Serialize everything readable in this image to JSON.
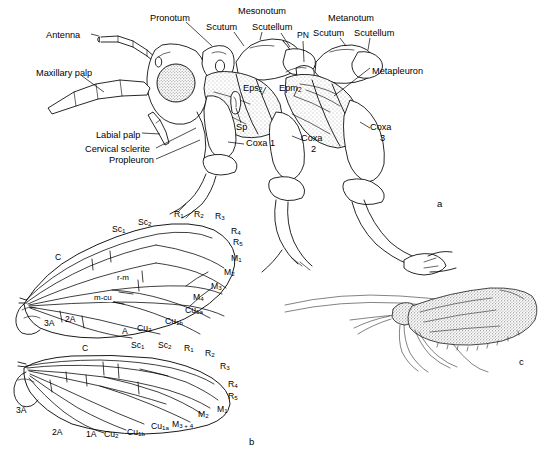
{
  "figure": {
    "panels": [
      {
        "id": "a",
        "letter": "a",
        "caption": "Lateral view of head and thorax with sclerites labeled"
      },
      {
        "id": "b",
        "letter": "b",
        "caption": "Forewing and hindwing venation"
      },
      {
        "id": "c",
        "letter": "c",
        "caption": "Whole adult in lateral view with wings at rest"
      }
    ]
  },
  "panel_a": {
    "letter": "a",
    "labels": [
      {
        "name": "antenna",
        "text": "Antenna",
        "x": 46,
        "y": 31,
        "align": "left"
      },
      {
        "name": "maxillary-palp",
        "text": "Maxillary palp",
        "x": 36,
        "y": 69,
        "align": "left"
      },
      {
        "name": "labial-palp",
        "text": "Labial palp",
        "x": 96,
        "y": 131,
        "align": "left"
      },
      {
        "name": "cervical-sclerite",
        "text": "Cervical sclerite",
        "x": 85,
        "y": 147,
        "align": "left"
      },
      {
        "name": "propleuron",
        "text": "Propleuron",
        "x": 109,
        "y": 158,
        "align": "left"
      },
      {
        "name": "pronotum",
        "text": "Pronotum",
        "x": 150,
        "y": 17,
        "align": "left"
      },
      {
        "name": "mesonotum",
        "text": "Mesonotum",
        "x": 238,
        "y": 10,
        "align": "left"
      },
      {
        "name": "meso-scutum",
        "text": "Scutum",
        "x": 210,
        "y": 26,
        "align": "left"
      },
      {
        "name": "meso-scutellum",
        "text": "Scutellum",
        "x": 255,
        "y": 26,
        "align": "left"
      },
      {
        "name": "postnotum",
        "text": "PN",
        "x": 298,
        "y": 34,
        "align": "left"
      },
      {
        "name": "metanotum",
        "text": "Metanotum",
        "x": 330,
        "y": 17,
        "align": "left"
      },
      {
        "name": "meta-scutum",
        "text": "Scutum",
        "x": 316,
        "y": 32,
        "align": "left"
      },
      {
        "name": "meta-scutellum",
        "text": "Scutellum",
        "x": 355,
        "y": 32,
        "align": "left"
      },
      {
        "name": "metapleuron",
        "text": "Metapleuron",
        "x": 372,
        "y": 71,
        "align": "left"
      },
      {
        "name": "spiracle",
        "text": "Sp",
        "x": 237,
        "y": 127,
        "align": "left"
      },
      {
        "name": "coxa-1",
        "text": "Coxa 1",
        "x": 246,
        "y": 147,
        "align": "left"
      },
      {
        "name": "coxa-2-line1",
        "text": "Coxa",
        "x": 303,
        "y": 140,
        "align": "left"
      },
      {
        "name": "coxa-2-line2",
        "text": "2",
        "x": 311,
        "y": 151,
        "align": "left"
      },
      {
        "name": "coxa-3-line1",
        "text": "Coxa",
        "x": 372,
        "y": 128,
        "align": "left"
      },
      {
        "name": "coxa-3-line2",
        "text": "3",
        "x": 380,
        "y": 139,
        "align": "left"
      }
    ],
    "subscript_labels": [
      {
        "name": "episternum-2",
        "base": "Eps",
        "sub": "2",
        "x": 245,
        "y": 89
      },
      {
        "name": "epimeron-2",
        "base": "Epm",
        "sub": "2",
        "x": 281,
        "y": 89
      }
    ]
  },
  "panel_b": {
    "letter": "b",
    "forewing": {
      "name": "forewing",
      "veins": [
        {
          "name": "vein-costa",
          "base": "C",
          "sub": "",
          "x": 57,
          "y": 258
        },
        {
          "name": "vein-sc1",
          "base": "Sc",
          "sub": "1",
          "x": 117,
          "y": 230
        },
        {
          "name": "vein-sc2",
          "base": "Sc",
          "sub": "2",
          "x": 142,
          "y": 223
        },
        {
          "name": "vein-r1",
          "base": "R",
          "sub": "1",
          "x": 176,
          "y": 214
        },
        {
          "name": "vein-r2",
          "base": "R",
          "sub": "2",
          "x": 196,
          "y": 214
        },
        {
          "name": "vein-r3",
          "base": "R",
          "sub": "3",
          "x": 217,
          "y": 216
        },
        {
          "name": "vein-r4",
          "base": "R",
          "sub": "4",
          "x": 232,
          "y": 231
        },
        {
          "name": "vein-r5",
          "base": "R",
          "sub": "5",
          "x": 234,
          "y": 242
        },
        {
          "name": "vein-m1",
          "base": "M",
          "sub": "1",
          "x": 232,
          "y": 258
        },
        {
          "name": "vein-m2",
          "base": "M",
          "sub": "2",
          "x": 225,
          "y": 272
        },
        {
          "name": "vein-m3",
          "base": "M",
          "sub": "3",
          "x": 212,
          "y": 286
        },
        {
          "name": "vein-m4",
          "base": "M",
          "sub": "4",
          "x": 194,
          "y": 297
        },
        {
          "name": "vein-cu1a",
          "base": "Cu",
          "sub": "1a",
          "x": 187,
          "y": 311
        },
        {
          "name": "vein-cu1b",
          "base": "Cu",
          "sub": "1b",
          "x": 167,
          "y": 322
        },
        {
          "name": "vein-cu2",
          "base": "Cu",
          "sub": "2",
          "x": 139,
          "y": 328
        },
        {
          "name": "vein-a",
          "base": "A",
          "sub": "",
          "x": 124,
          "y": 331
        },
        {
          "name": "vein-2a",
          "base": "2A",
          "sub": "",
          "x": 67,
          "y": 320
        },
        {
          "name": "vein-3a",
          "base": "3A",
          "sub": "",
          "x": 46,
          "y": 324
        }
      ],
      "crossveins": [
        {
          "name": "crossvein-r-m",
          "text": "r-m",
          "x": 118,
          "y": 278
        },
        {
          "name": "crossvein-m-cu",
          "text": "m-cu",
          "x": 96,
          "y": 298
        }
      ]
    },
    "hindwing": {
      "name": "hindwing",
      "veins": [
        {
          "name": "hw-vein-costa",
          "base": "C",
          "sub": "",
          "x": 84,
          "y": 349
        },
        {
          "name": "hw-vein-sc1",
          "base": "Sc",
          "sub": "1",
          "x": 135,
          "y": 345
        },
        {
          "name": "hw-vein-sc2",
          "base": "Sc",
          "sub": "2",
          "x": 161,
          "y": 345
        },
        {
          "name": "hw-vein-r1",
          "base": "R",
          "sub": "1",
          "x": 185,
          "y": 348
        },
        {
          "name": "hw-vein-r2",
          "base": "R",
          "sub": "2",
          "x": 206,
          "y": 353
        },
        {
          "name": "hw-vein-r3",
          "base": "R",
          "sub": "3",
          "x": 221,
          "y": 366
        },
        {
          "name": "hw-vein-r4",
          "base": "R",
          "sub": "4",
          "x": 229,
          "y": 384
        },
        {
          "name": "hw-vein-r5",
          "base": "R",
          "sub": "5",
          "x": 229,
          "y": 396
        },
        {
          "name": "hw-vein-m1",
          "base": "M",
          "sub": "1",
          "x": 218,
          "y": 409
        },
        {
          "name": "hw-vein-m2",
          "base": "M",
          "sub": "2",
          "x": 199,
          "y": 414
        },
        {
          "name": "hw-vein-m34",
          "base": "M",
          "sub": "3 + 4",
          "x": 174,
          "y": 424
        },
        {
          "name": "hw-vein-cu1a",
          "base": "Cu",
          "sub": "1a",
          "x": 153,
          "y": 427
        },
        {
          "name": "hw-vein-cu1b",
          "base": "Cu",
          "sub": "1b",
          "x": 129,
          "y": 432
        },
        {
          "name": "hw-vein-cu2",
          "base": "Cu",
          "sub": "2",
          "x": 106,
          "y": 434
        },
        {
          "name": "hw-vein-1a",
          "base": "1A",
          "sub": "",
          "x": 88,
          "y": 434
        },
        {
          "name": "hw-vein-2A",
          "base": "2A",
          "sub": "",
          "x": 54,
          "y": 432
        },
        {
          "name": "hw-vein-3A",
          "base": "3A",
          "sub": "",
          "x": 18,
          "y": 410
        }
      ]
    }
  },
  "panel_c": {
    "letter": "c",
    "subject": "adult caddisfly, lateral habitus with tent-like wings"
  }
}
